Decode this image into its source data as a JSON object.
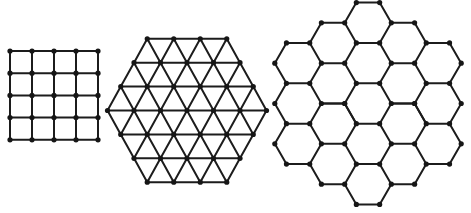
{
  "figure": {
    "caption_visible_text": "",
    "caption_note": "Top caption line is cropped off; only descenders visible",
    "colors": {
      "line": "#1c1c1c",
      "node": "#161616",
      "background": "#ffffff"
    },
    "lattices": [
      {
        "name": "square-lattice",
        "type": "square",
        "rows": 5,
        "columns": 5,
        "nodes": 25
      },
      {
        "name": "triangular-lattice",
        "type": "triangular",
        "shape": "hexagon",
        "row_node_counts": [
          4,
          5,
          6,
          7,
          6,
          5,
          4
        ],
        "nodes": 37
      },
      {
        "name": "honeycomb-lattice",
        "type": "honeycomb",
        "shape": "hexagon",
        "column_hex_counts": [
          3,
          4,
          5,
          4,
          3
        ],
        "hexagons": 19
      }
    ]
  }
}
